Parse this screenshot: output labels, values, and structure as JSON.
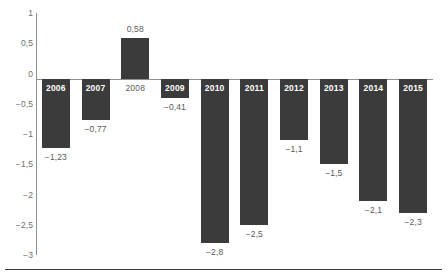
{
  "chart_data": {
    "type": "bar",
    "title": "",
    "subtitle": "",
    "xlabel": "",
    "ylabel": "",
    "categories": [
      "2006",
      "2007",
      "2008",
      "2009",
      "2010",
      "2011",
      "2012",
      "2013",
      "2014",
      "2015"
    ],
    "values": [
      -1.23,
      -0.77,
      0.58,
      -0.41,
      -2.8,
      -2.5,
      -1.1,
      -1.5,
      -2.1,
      -2.3
    ],
    "value_labels": [
      "−1,23",
      "−0,77",
      "0,58",
      "−0,41",
      "−2,8",
      "−2,5",
      "−1,1",
      "−1,5",
      "−2,1",
      "−2,3"
    ],
    "ylim": [
      -3,
      1
    ],
    "ytick_values": [
      1,
      0.5,
      0,
      -0.5,
      -1,
      -1.5,
      -2,
      -2.5,
      -3
    ],
    "ytick_labels": [
      "1",
      "0,5",
      "0",
      "−0,5",
      "−1",
      "−1,5",
      "−2",
      "−2,5",
      "−3"
    ],
    "grid": false,
    "legend": null,
    "legend_position": "none",
    "series": [
      {
        "name": "",
        "values": [
          -1.23,
          -0.77,
          0.58,
          -0.41,
          -2.8,
          -2.5,
          -1.1,
          -1.5,
          -2.1,
          -2.3
        ]
      }
    ],
    "bar_color": "#3b3b3b",
    "axis_color": "#8f8f8f",
    "tick_label_color": "#6d6d6d",
    "value_label_color": "#5a5a5a",
    "category_label_inside_color": "#ffffff",
    "category_label_outside_color": "#5d5d5d",
    "baseline_rule_color": "#3d3d3d",
    "background_color": "#ffffff",
    "decimal_separator": ",",
    "negative_sign": "−"
  }
}
